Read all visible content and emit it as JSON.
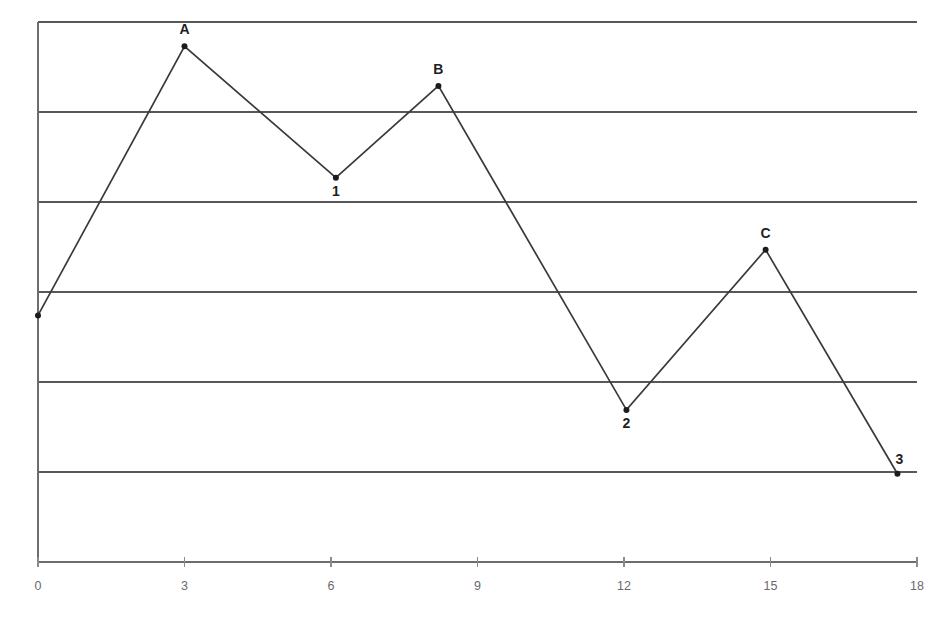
{
  "chart_data": {
    "type": "line",
    "title": "",
    "subtitle": "",
    "xlabel": "",
    "ylabel": "",
    "xlim": [
      0,
      18
    ],
    "ylim": [
      0,
      6
    ],
    "grid": "horizontal",
    "legend": "none",
    "xticks": [
      "0",
      "3",
      "6",
      "9",
      "12",
      "15",
      "18"
    ],
    "xtick_values": [
      0,
      3,
      6,
      9,
      12,
      15,
      18
    ],
    "yticks": [],
    "gridline_values": [
      0,
      1,
      2,
      3,
      4,
      5,
      6
    ],
    "series": [
      {
        "name": "series-1",
        "color": "#3a3a3c",
        "marker": "dot",
        "x": [
          0,
          3,
          6.1,
          8.2,
          12.05,
          14.9,
          17.6
        ],
        "y": [
          2.74,
          5.73,
          4.27,
          5.29,
          1.69,
          3.47,
          0.98
        ],
        "point_labels": [
          "",
          "A",
          "1",
          "B",
          "2",
          "C",
          "3"
        ],
        "label_positions": [
          "",
          "above",
          "below",
          "above",
          "below",
          "above",
          "above-right"
        ]
      }
    ],
    "annotations": [
      {
        "text": "A",
        "x": 3,
        "y": 5.73,
        "placement": "above"
      },
      {
        "text": "1",
        "x": 6.1,
        "y": 4.27,
        "placement": "below"
      },
      {
        "text": "B",
        "x": 8.2,
        "y": 5.29,
        "placement": "above"
      },
      {
        "text": "2",
        "x": 12.05,
        "y": 1.69,
        "placement": "below"
      },
      {
        "text": "C",
        "x": 14.9,
        "y": 3.47,
        "placement": "above"
      },
      {
        "text": "3",
        "x": 17.6,
        "y": 0.98,
        "placement": "above-right"
      }
    ],
    "colors": {
      "background": "#ffffff",
      "line": "#3a3a3c",
      "marker": "#1c1c1e",
      "grid": "#58585a",
      "axis": "#6d6d70",
      "tick_text": "#6a6a6d",
      "label_text": "#1f1f21"
    },
    "geometry": {
      "plot_left": 38,
      "plot_right": 917,
      "plot_top": 22,
      "plot_bottom": 562,
      "x_px_per_unit": 48.833,
      "y_px_per_unit": 90.0
    }
  }
}
